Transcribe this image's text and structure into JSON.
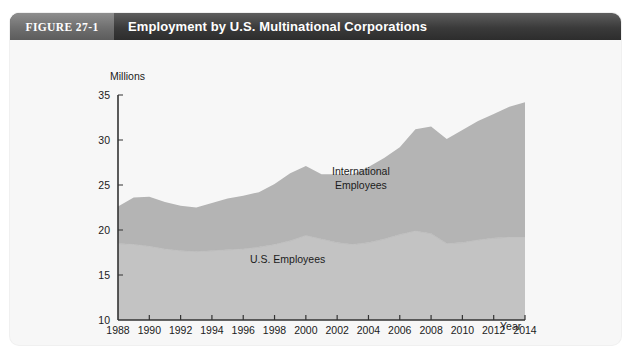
{
  "figure": {
    "tag": "FIGURE 27-1",
    "title": "Employment by U.S. Multinational Corporations"
  },
  "colors": {
    "header_dark": "#3a3a3a",
    "header_tag": "#6f6f6f",
    "card_background": "#f7f7f7",
    "international_band": "#b4b4b4",
    "us_band": "#c3c3c3",
    "axis": "#333333",
    "text": "#1b1b1b"
  },
  "labels": {
    "y_unit": "Millions",
    "x_title": "Year",
    "series_international": "International\nEmployees",
    "series_us": "U.S. Employees"
  },
  "chart_data": {
    "type": "area",
    "stacked": true,
    "title": "Employment by U.S. Multinational Corporations",
    "xlabel": "Year",
    "ylabel": "Millions",
    "xlim": [
      1988,
      2014
    ],
    "ylim": [
      10,
      35
    ],
    "ytick_step": 5,
    "xtick_step": 2,
    "grid": false,
    "legend": "inline-annotations",
    "x": [
      1988,
      1989,
      1990,
      1991,
      1992,
      1993,
      1994,
      1995,
      1996,
      1997,
      1998,
      1999,
      2000,
      2001,
      2002,
      2003,
      2004,
      2005,
      2006,
      2007,
      2008,
      2009,
      2010,
      2011,
      2012,
      2013,
      2014
    ],
    "ytick_labels": [
      "10",
      "15",
      "20",
      "25",
      "30",
      "35"
    ],
    "xtick_labels": [
      "1988",
      "1990",
      "1992",
      "1994",
      "1996",
      "1998",
      "2000",
      "2002",
      "2004",
      "2006",
      "2008",
      "2010",
      "2012",
      "2014"
    ],
    "series": [
      {
        "name": "U.S. Employees",
        "values": [
          18.5,
          18.4,
          18.2,
          17.9,
          17.7,
          17.6,
          17.7,
          17.8,
          17.9,
          18.1,
          18.4,
          18.8,
          19.4,
          19.0,
          18.6,
          18.4,
          18.6,
          19.0,
          19.5,
          19.9,
          19.6,
          18.5,
          18.6,
          18.9,
          19.1,
          19.2,
          19.2
        ]
      },
      {
        "name": "International Employees",
        "values": [
          4.1,
          5.2,
          5.5,
          5.2,
          5.0,
          4.9,
          5.3,
          5.7,
          5.9,
          6.1,
          6.7,
          7.5,
          7.7,
          7.2,
          7.6,
          7.8,
          8.4,
          9.0,
          9.7,
          11.3,
          11.9,
          11.6,
          12.5,
          13.2,
          13.8,
          14.5,
          15.0
        ]
      }
    ],
    "totals": [
      22.6,
      23.6,
      23.7,
      23.1,
      22.7,
      22.5,
      23.0,
      23.5,
      23.8,
      24.2,
      25.1,
      26.3,
      27.1,
      26.2,
      26.2,
      26.2,
      27.0,
      28.0,
      29.2,
      31.2,
      31.5,
      30.1,
      31.1,
      32.1,
      32.9,
      33.7,
      34.2
    ]
  }
}
